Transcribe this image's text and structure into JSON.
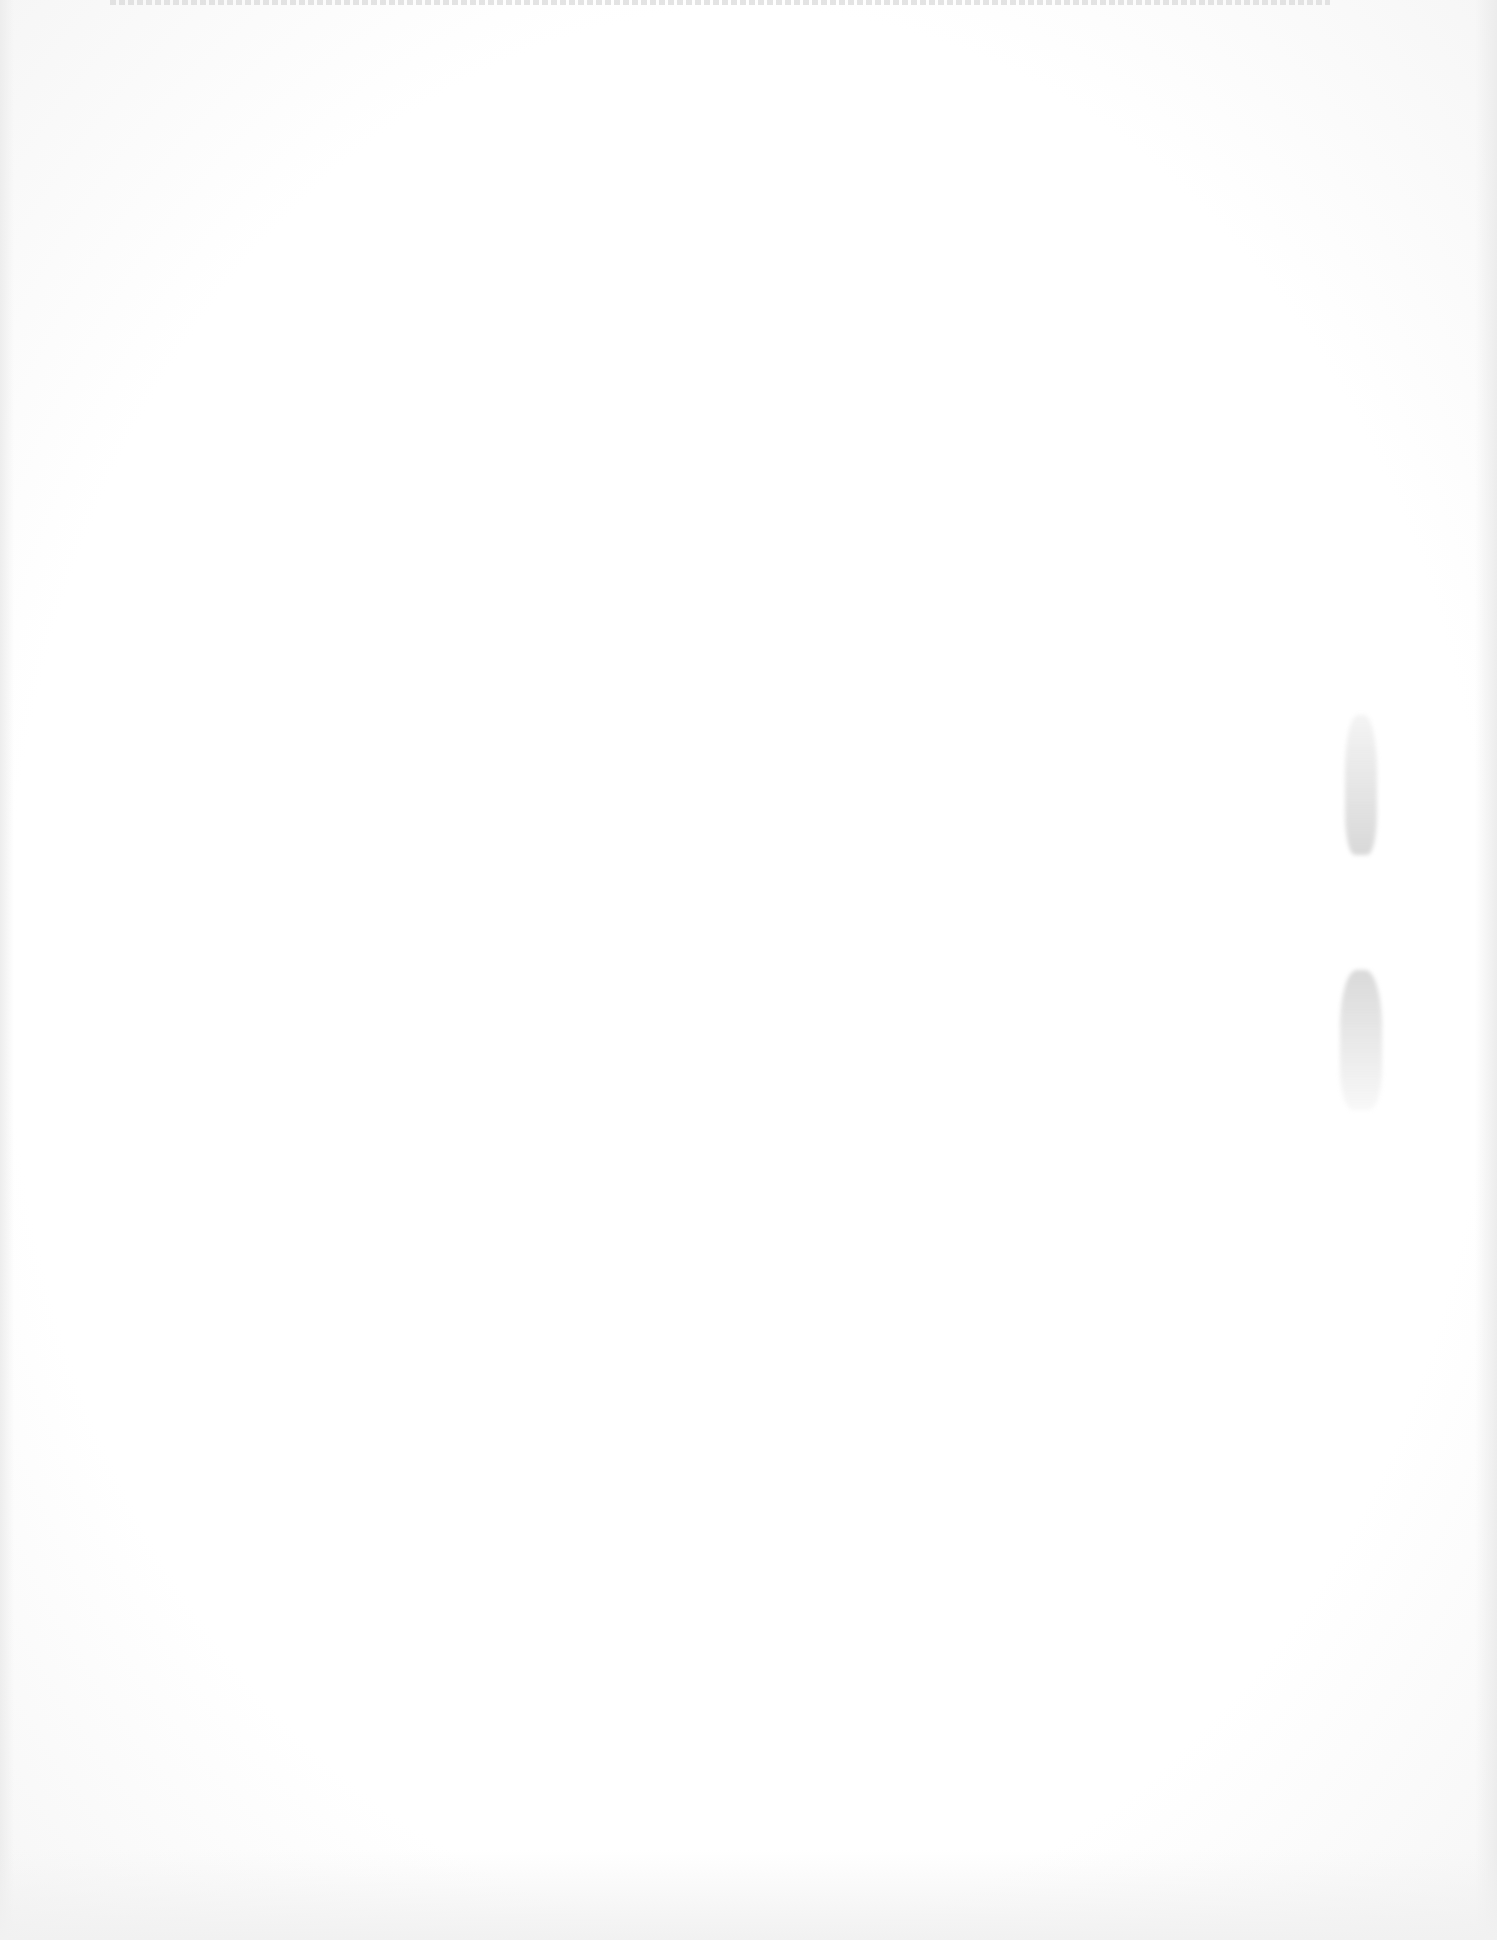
{
  "page": {
    "type": "blank-scanned-page",
    "background_color": "#ffffff",
    "top_edge_text": "",
    "body_text": ""
  }
}
